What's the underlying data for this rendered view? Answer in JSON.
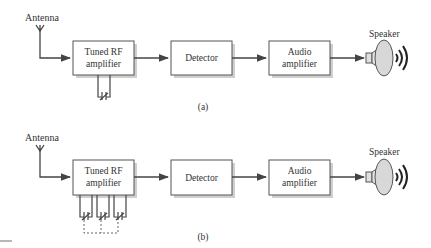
{
  "diagrams": [
    {
      "id": "a",
      "caption": "(a)",
      "antenna_label": "Antenna",
      "blocks": [
        {
          "line1": "Tuned RF",
          "line2": "amplifier"
        },
        {
          "line1": "Detector",
          "line2": ""
        },
        {
          "line1": "Audio",
          "line2": "amplifier"
        }
      ],
      "speaker_label": "Speaker",
      "tuning_capacitors": 1
    },
    {
      "id": "b",
      "caption": "(b)",
      "antenna_label": "Antenna",
      "blocks": [
        {
          "line1": "Tuned RF",
          "line2": "amplifier"
        },
        {
          "line1": "Detector",
          "line2": ""
        },
        {
          "line1": "Audio",
          "line2": "amplifier"
        }
      ],
      "speaker_label": "Speaker",
      "tuning_capacitors": 3,
      "ganged": true
    }
  ],
  "colors": {
    "line": "#444444",
    "box_shadow": "#c8c8c8",
    "speaker_fill": "#d8d8d8"
  }
}
